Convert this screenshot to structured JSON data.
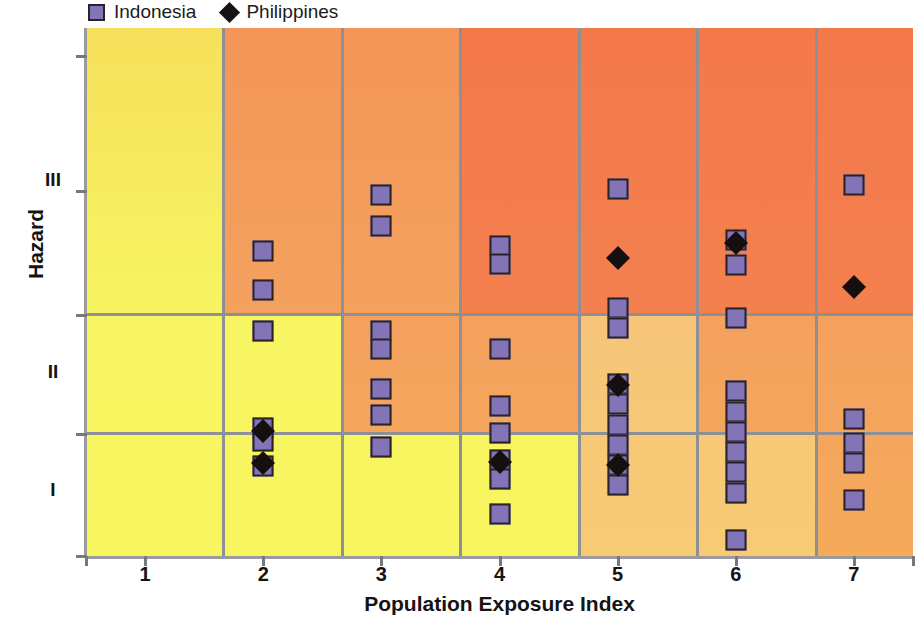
{
  "legend": {
    "position": "top-left",
    "entries": [
      {
        "label": "Indonesia",
        "marker": "square",
        "color": "#8274b6",
        "icon": "square-marker-icon"
      },
      {
        "label": "Philippines",
        "marker": "diamond",
        "color": "#15100f",
        "icon": "diamond-marker-icon"
      }
    ]
  },
  "axes": {
    "x_title": "Population Exposure Index",
    "y_title": "Hazard",
    "x_ticks": [
      "1",
      "2",
      "3",
      "4",
      "5",
      "6",
      "7"
    ],
    "y_ticks": [
      "III",
      "II",
      "I"
    ]
  },
  "chart_data": {
    "type": "scatter",
    "title": "",
    "xlabel": "Population Exposure Index",
    "ylabel": "Hazard",
    "xlim": [
      0.5,
      7.5
    ],
    "ylim": [
      0,
      3
    ],
    "x": [
      1,
      2,
      3,
      4,
      5,
      6,
      7
    ],
    "x_tick_labels": [
      "1",
      "2",
      "3",
      "4",
      "5",
      "6",
      "7"
    ],
    "y_tick_labels": [
      "I",
      "II",
      "III"
    ],
    "grid": true,
    "legend_position": "top-left",
    "background": "risk-matrix-gradient yellow(low-left) to red(high-right)",
    "series": [
      {
        "name": "Indonesia",
        "marker": "square",
        "color": "#8274b6",
        "points": [
          {
            "x": 2,
            "y": 2.53
          },
          {
            "x": 2,
            "y": 2.2
          },
          {
            "x": 2,
            "y": 1.86
          },
          {
            "x": 2,
            "y": 1.04
          },
          {
            "x": 2,
            "y": 0.93
          },
          {
            "x": 2,
            "y": 0.72
          },
          {
            "x": 3,
            "y": 3.0
          },
          {
            "x": 3,
            "y": 2.74
          },
          {
            "x": 3,
            "y": 1.86
          },
          {
            "x": 3,
            "y": 1.71
          },
          {
            "x": 3,
            "y": 1.37
          },
          {
            "x": 3,
            "y": 1.15
          },
          {
            "x": 3,
            "y": 0.88
          },
          {
            "x": 4,
            "y": 2.57
          },
          {
            "x": 4,
            "y": 2.42
          },
          {
            "x": 4,
            "y": 1.71
          },
          {
            "x": 4,
            "y": 1.23
          },
          {
            "x": 4,
            "y": 1.0
          },
          {
            "x": 4,
            "y": 0.77
          },
          {
            "x": 4,
            "y": 0.61
          },
          {
            "x": 4,
            "y": 0.32
          },
          {
            "x": 5,
            "y": 3.05
          },
          {
            "x": 5,
            "y": 2.05
          },
          {
            "x": 5,
            "y": 1.88
          },
          {
            "x": 5,
            "y": 1.41
          },
          {
            "x": 5,
            "y": 1.24
          },
          {
            "x": 5,
            "y": 1.07
          },
          {
            "x": 5,
            "y": 0.9
          },
          {
            "x": 5,
            "y": 0.73
          },
          {
            "x": 5,
            "y": 0.56
          },
          {
            "x": 6,
            "y": 2.62
          },
          {
            "x": 6,
            "y": 2.41
          },
          {
            "x": 6,
            "y": 1.97
          },
          {
            "x": 6,
            "y": 1.35
          },
          {
            "x": 6,
            "y": 1.18
          },
          {
            "x": 6,
            "y": 1.01
          },
          {
            "x": 6,
            "y": 0.84
          },
          {
            "x": 6,
            "y": 0.67
          },
          {
            "x": 6,
            "y": 0.5
          },
          {
            "x": 6,
            "y": 0.1
          },
          {
            "x": 7,
            "y": 3.08
          },
          {
            "x": 7,
            "y": 1.12
          },
          {
            "x": 7,
            "y": 0.92
          },
          {
            "x": 7,
            "y": 0.75
          },
          {
            "x": 7,
            "y": 0.44
          }
        ]
      },
      {
        "name": "Philippines",
        "marker": "diamond",
        "color": "#15100f",
        "points": [
          {
            "x": 2,
            "y": 1.02
          },
          {
            "x": 2,
            "y": 0.75
          },
          {
            "x": 4,
            "y": 0.76
          },
          {
            "x": 5,
            "y": 2.47
          },
          {
            "x": 5,
            "y": 1.4
          },
          {
            "x": 5,
            "y": 0.73
          },
          {
            "x": 6,
            "y": 2.6
          },
          {
            "x": 7,
            "y": 2.23
          }
        ]
      }
    ]
  },
  "cells": {
    "note": "background risk matrix colors per column band and hazard row",
    "colors": {
      "yellow": "#f7f562",
      "light_orange": "#f6c57a",
      "orange": "#f4a15e",
      "deep_orange": "#f4804f",
      "red_orange": "#f4674b",
      "grid_line": "#8f8f96"
    }
  }
}
